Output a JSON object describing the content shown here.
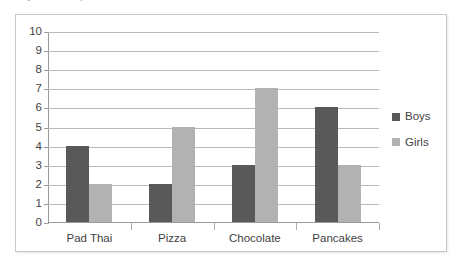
{
  "cropped_header_text": "ecord your own responses in the table below.",
  "chart_data": {
    "type": "bar",
    "title": "",
    "xlabel": "",
    "ylabel": "",
    "categories": [
      "Pad Thai",
      "Pizza",
      "Chocolate",
      "Pancakes"
    ],
    "series": [
      {
        "name": "Boys",
        "color": "#595959",
        "values": [
          4,
          2,
          3,
          6
        ]
      },
      {
        "name": "Girls",
        "color": "#b2b2b2",
        "values": [
          2,
          5,
          7,
          3
        ]
      }
    ],
    "ylim": [
      0,
      10
    ],
    "ytick_step": 1,
    "ytick_labels": [
      "10",
      "9",
      "8",
      "7",
      "6",
      "5",
      "4",
      "3",
      "2",
      "1",
      "0"
    ],
    "grid": true,
    "legend_position": "right"
  },
  "colors": {
    "boys": "#595959",
    "girls": "#b2b2b2",
    "gridline": "#b9b9b9",
    "axis": "#9a9a9a",
    "frame_border": "#c8c8c8",
    "plot_background": "#ffffff",
    "text": "#3f3f3f"
  }
}
